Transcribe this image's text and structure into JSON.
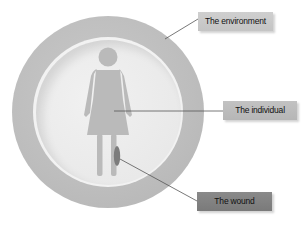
{
  "diagram": {
    "type": "concentric-circles-with-callouts",
    "labels": {
      "environment": "The environment",
      "individual": "The individual",
      "wound": "The wound"
    },
    "elements": [
      {
        "name": "outer-ring",
        "represents": "The environment",
        "color": "#bdbdbd"
      },
      {
        "name": "inner-circle",
        "represents": "The individual",
        "color": "#e8e8e8"
      },
      {
        "name": "female-figure",
        "represents": "The individual",
        "color": "#bababa"
      },
      {
        "name": "wound-mark",
        "represents": "The wound",
        "color": "#7c7c7c"
      }
    ],
    "colors": {
      "ring": "#bdbdbd",
      "inner": "#e8e8e8",
      "figure": "#bababa",
      "wound": "#7c7c7c",
      "leader_line": "#555555"
    }
  }
}
